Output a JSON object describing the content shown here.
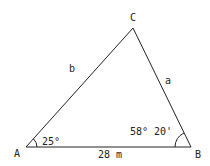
{
  "diagram": {
    "type": "triangle",
    "vertices": {
      "A": {
        "label": "A"
      },
      "B": {
        "label": "B"
      },
      "C": {
        "label": "C"
      }
    },
    "sides": {
      "a": {
        "label": "a"
      },
      "b": {
        "label": "b"
      },
      "c": {
        "label": "28 m"
      }
    },
    "angles": {
      "A": {
        "label": "25°"
      },
      "B": {
        "label": "58° 20'"
      }
    },
    "colors": {
      "stroke": "#222222",
      "background": "#ffffff"
    }
  }
}
